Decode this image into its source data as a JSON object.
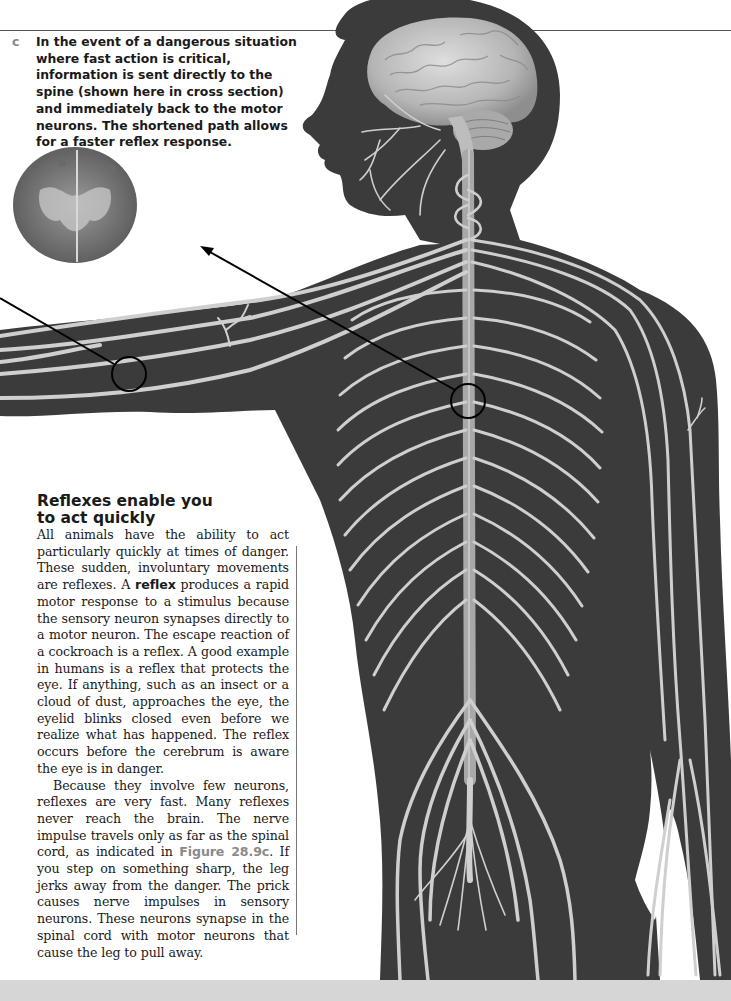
{
  "page": {
    "type": "textbook page",
    "colors": {
      "body_silhouette": "#3b3b3b",
      "nerve": "#cfcfcf",
      "brain": "#b9b9b9",
      "caption_letter": "#888888",
      "figure_reference": "#8a8a8a",
      "text": "#1a1a1a",
      "bottom_band": "#d6d6d6"
    }
  },
  "figure": {
    "panel_letter": "c",
    "caption": "In the event of a dangerous situation where fast action is critical, information is sent directly to the spine (shown here in cross section) and immediately back to the motor neurons. The shortened path allows for a faster reflex response.",
    "illustration": "Human nervous system: brain, spinal cord, peripheral nerves; inset shows spinal cord cross section",
    "callouts": [
      {
        "name": "arm-nerve-circle",
        "cx": 129,
        "cy": 374,
        "r": 17
      },
      {
        "name": "spinal-cord-circle",
        "cx": 468,
        "cy": 401,
        "r": 17
      }
    ]
  },
  "article": {
    "heading_line1": "Reflexes enable you",
    "heading_line2": "to act quickly",
    "p1_before": "All animals have the ability to act particularly quickly at times of danger. These sudden, involuntary movements are reflexes. A ",
    "p1_term": "reflex",
    "p1_after": " produces a rapid motor response to a stimulus because the sensory neuron synapses directly to a motor neuron. The escape reaction of a cockroach is a reflex. A good example in humans is a reflex that protects the eye. If anything, such as an insect or a cloud of dust, approaches the eye, the eyelid blinks closed even before we realize what has happened. The reflex occurs before the cerebrum is aware the eye is in danger.",
    "p2_before": "Because they involve few neurons, reflexes are very fast. Many reflexes never reach the brain. The nerve impulse travels only as far as the spinal cord, as indicated in ",
    "p2_figref": "Figure 28.9c",
    "p2_after": ". If you step on something sharp, the leg jerks away from the danger. The prick causes nerve impulses in sensory neurons. These neurons synapse in the spinal cord with motor neurons that cause the leg to pull away."
  }
}
